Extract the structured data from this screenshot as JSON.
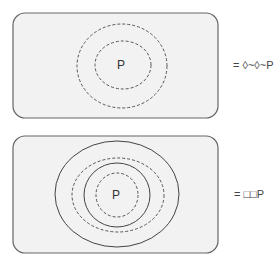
{
  "diagrams": [
    {
      "center_label": "P",
      "equation": "= ◊~◊~P",
      "rings": [
        "dashed",
        "dashed"
      ]
    },
    {
      "center_label": "P",
      "equation": "= □□P",
      "rings": [
        "solid",
        "dashed",
        "solid",
        "dashed"
      ]
    }
  ],
  "colors": {
    "box_fill": "#f2f2f2",
    "stroke": "#555555",
    "text": "#333333"
  }
}
